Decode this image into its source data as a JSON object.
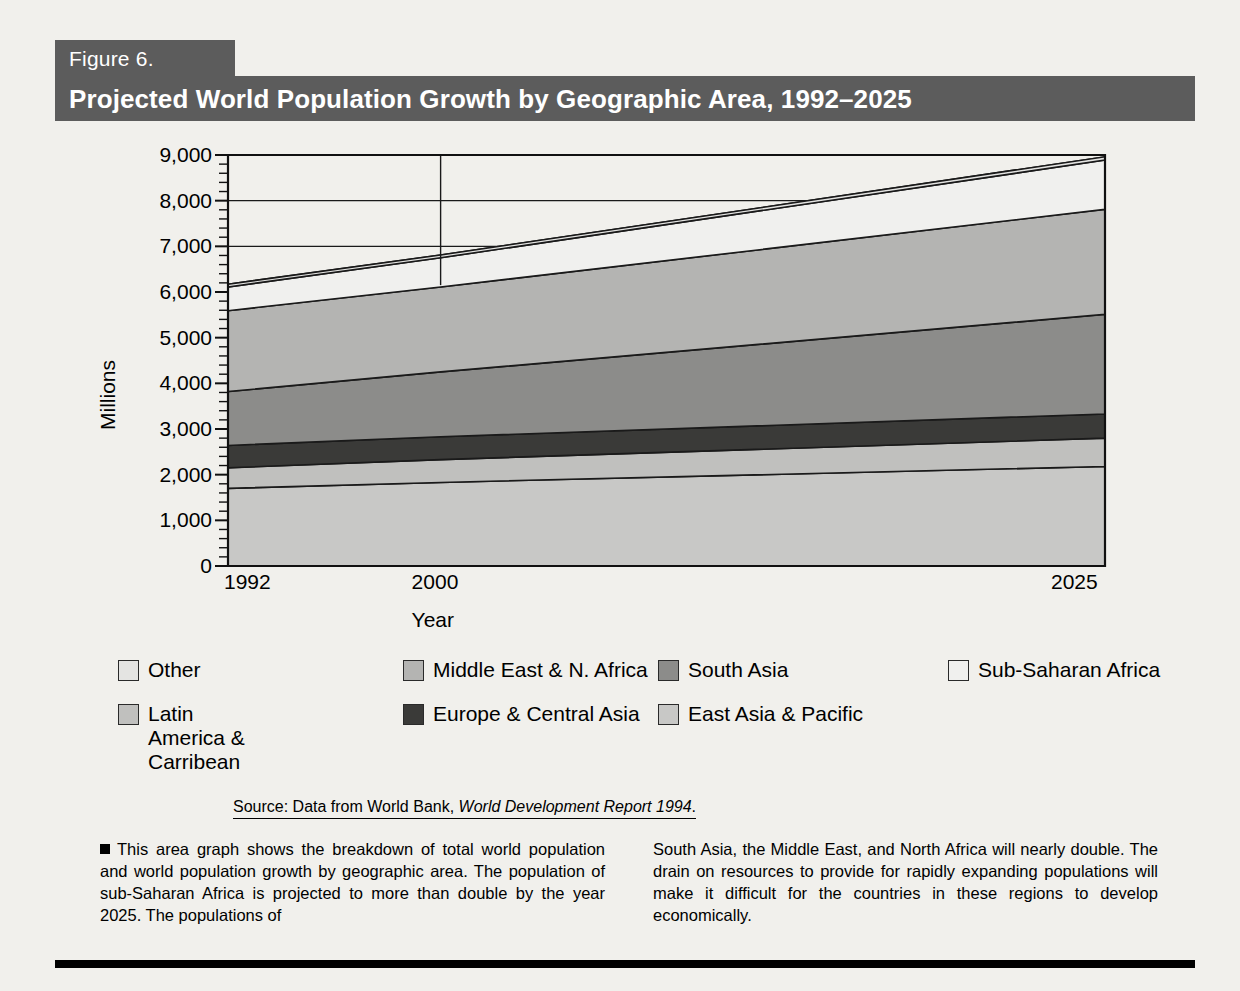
{
  "figure": {
    "number_label": "Figure 6.",
    "title": "Projected World Population Growth by Geographic Area, 1992–2025"
  },
  "source": {
    "prefix": "Source: Data from World Bank, ",
    "italic": "World Development Report 1994",
    "suffix": "."
  },
  "body": {
    "left": "This area graph shows the breakdown of total world population and world population growth by geographic area. The population of sub-Saharan Africa is projected to more than double by the year 2025. The populations of",
    "right": "South Asia, the Middle East, and North Africa will nearly double. The drain on resources to provide for rapidly expanding populations will make it difficult for the countries in these regions to develop economically."
  },
  "legend": {
    "row1": [
      {
        "label": "Other",
        "color": "#e4e4e2"
      },
      {
        "label": "Middle East & N. Africa",
        "color": "#b4b4b2"
      },
      {
        "label": "South Asia",
        "color": "#8c8c8a"
      },
      {
        "label": "Sub-Saharan Africa",
        "color": "#f0f0ee"
      }
    ],
    "row2": [
      {
        "label": "Latin America & Carribean",
        "color": "#c0c0be"
      },
      {
        "label": "Europe & Central Asia",
        "color": "#3a3a38"
      },
      {
        "label": "East Asia & Pacific",
        "color": "#c8c8c6"
      }
    ]
  },
  "chart_data": {
    "type": "area",
    "stacked": true,
    "title": "Projected World Population Growth by Geographic Area, 1992–2025",
    "xlabel": "Year",
    "ylabel": "Millions",
    "x": [
      1992,
      2000,
      2025
    ],
    "xtick_labels": [
      "1992",
      "2000",
      "2025"
    ],
    "ytick_labels": [
      "0",
      "1,000",
      "2,000",
      "3,000",
      "4,000",
      "5,000",
      "6,000",
      "7,000",
      "8,000",
      "9,000"
    ],
    "ytick_values": [
      0,
      1000,
      2000,
      3000,
      4000,
      5000,
      6000,
      7000,
      8000,
      9000
    ],
    "ylim": [
      0,
      9000
    ],
    "xlim": [
      1992,
      2025
    ],
    "grid": true,
    "legend_position": "below",
    "annotations": [
      {
        "type": "vertical-marker",
        "x": 2000,
        "from": 9000,
        "to": 6150,
        "label": "2000"
      }
    ],
    "series": [
      {
        "name": "East Asia & Pacific",
        "color": "#c8c8c6",
        "values": [
          1700,
          1830,
          2180
        ]
      },
      {
        "name": "Latin America & Carribean",
        "color": "#c0c0be",
        "values": [
          450,
          500,
          620
        ]
      },
      {
        "name": "Europe & Central Asia",
        "color": "#3a3a38",
        "values": [
          490,
          500,
          530
        ]
      },
      {
        "name": "South Asia",
        "color": "#8c8c8a",
        "values": [
          1180,
          1420,
          2180
        ]
      },
      {
        "name": "Middle East & N. Africa",
        "color": "#b4b4b2",
        "values": [
          1770,
          1860,
          2300
        ]
      },
      {
        "name": "Sub-Saharan Africa",
        "color": "#f0f0ee",
        "values": [
          520,
          640,
          1080
        ]
      },
      {
        "name": "Other",
        "color": "#e4e4e2",
        "values": [
          60,
          60,
          70
        ]
      }
    ],
    "cumulative_totals": [
      5450,
      6150,
      8230
    ]
  }
}
